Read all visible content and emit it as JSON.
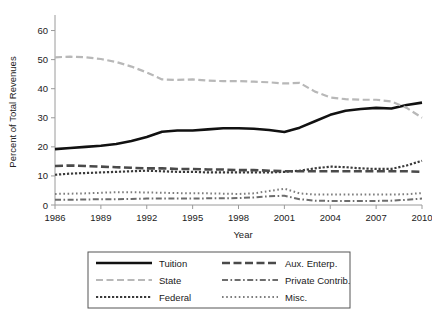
{
  "chart_data": {
    "type": "line",
    "title": "",
    "xlabel": "Year",
    "ylabel": "Percent of Total Revenues",
    "xlim": [
      1986,
      2010
    ],
    "ylim": [
      0,
      65
    ],
    "yticks": [
      0,
      10,
      20,
      30,
      40,
      50,
      60
    ],
    "xticks": [
      1986,
      1989,
      1992,
      1995,
      1998,
      2001,
      2004,
      2007,
      2010
    ],
    "grid": false,
    "legend_position": "below-center",
    "x": [
      1986,
      1987,
      1988,
      1989,
      1990,
      1991,
      1992,
      1993,
      1994,
      1995,
      1996,
      1997,
      1998,
      1999,
      2000,
      2001,
      2002,
      2003,
      2004,
      2005,
      2006,
      2007,
      2008,
      2009,
      2010
    ],
    "series": [
      {
        "name": "Tuition",
        "style": "solid",
        "color": "#111111",
        "width": 2.6,
        "values": [
          19.2,
          19.6,
          20.0,
          20.4,
          21.0,
          22.0,
          23.4,
          25.2,
          25.6,
          25.6,
          26.0,
          26.4,
          26.4,
          26.2,
          25.8,
          25.1,
          26.6,
          28.8,
          31.0,
          32.4,
          33.0,
          33.4,
          33.2,
          34.4,
          35.2
        ]
      },
      {
        "name": "State",
        "style": "dashed-light",
        "color": "#b8b8b8",
        "width": 2.2,
        "values": [
          50.8,
          51.0,
          50.8,
          50.2,
          49.2,
          47.6,
          45.6,
          43.2,
          43.0,
          43.2,
          42.8,
          42.6,
          42.6,
          42.4,
          42.2,
          41.8,
          42.0,
          39.0,
          37.0,
          36.4,
          36.2,
          36.2,
          35.6,
          33.4,
          30.0
        ]
      },
      {
        "name": "Federal",
        "style": "dotted-dense",
        "color": "#3a3a3a",
        "width": 2.2,
        "values": [
          10.4,
          10.8,
          11.0,
          11.2,
          11.4,
          11.6,
          11.8,
          11.6,
          11.4,
          11.4,
          11.2,
          11.2,
          11.2,
          11.2,
          11.2,
          11.4,
          11.8,
          12.6,
          13.2,
          13.0,
          12.6,
          12.4,
          12.4,
          13.6,
          15.2
        ]
      },
      {
        "name": "Aux. Enterp.",
        "style": "dashed-dark",
        "color": "#4a4a4a",
        "width": 2.6,
        "values": [
          13.4,
          13.6,
          13.4,
          13.2,
          13.0,
          12.8,
          12.6,
          12.6,
          12.4,
          12.4,
          12.2,
          12.2,
          12.0,
          12.0,
          11.8,
          11.6,
          11.6,
          11.6,
          11.6,
          11.6,
          11.6,
          11.6,
          11.6,
          11.6,
          11.4
        ]
      },
      {
        "name": "Private Contrib.",
        "style": "dashdot",
        "color": "#6d6d6d",
        "width": 2.0,
        "values": [
          1.8,
          1.8,
          1.9,
          2.0,
          2.0,
          2.1,
          2.2,
          2.2,
          2.2,
          2.2,
          2.3,
          2.3,
          2.4,
          2.6,
          3.0,
          3.2,
          2.0,
          1.5,
          1.4,
          1.4,
          1.4,
          1.4,
          1.5,
          1.8,
          2.2
        ]
      },
      {
        "name": "Misc.",
        "style": "dotted-fine",
        "color": "#7d7d7d",
        "width": 2.0,
        "values": [
          3.8,
          3.9,
          4.0,
          4.2,
          4.4,
          4.4,
          4.3,
          4.2,
          4.1,
          4.0,
          4.0,
          3.9,
          3.8,
          4.0,
          4.8,
          5.6,
          4.0,
          3.6,
          3.6,
          3.6,
          3.6,
          3.6,
          3.6,
          3.7,
          4.1
        ]
      }
    ]
  },
  "axis": {
    "ylabel": "Percent of Total Revenues",
    "xlabel": "Year",
    "yticks": [
      "0",
      "10",
      "20",
      "30",
      "40",
      "50",
      "60"
    ],
    "xticks": [
      "1986",
      "1989",
      "1992",
      "1995",
      "1998",
      "2001",
      "2004",
      "2007",
      "2010"
    ]
  },
  "legend": {
    "entries": [
      {
        "label": "Tuition",
        "key": "tuition"
      },
      {
        "label": "Aux. Enterp.",
        "key": "aux-enterp"
      },
      {
        "label": "State",
        "key": "state"
      },
      {
        "label": "Private Contrib.",
        "key": "private-contrib"
      },
      {
        "label": "Federal",
        "key": "federal"
      },
      {
        "label": "Misc.",
        "key": "misc"
      }
    ]
  }
}
